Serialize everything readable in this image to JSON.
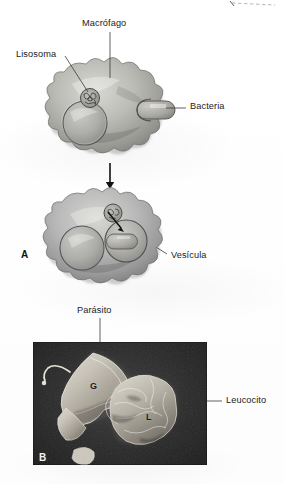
{
  "figure": {
    "kind": "textbook-figure",
    "language": "es"
  },
  "panel_a": {
    "letter": "A",
    "labels": {
      "macrofago": "Macrófago",
      "lisosoma": "Lisosoma",
      "bacteria": "Bacteria",
      "vesicula": "Vesícula"
    }
  },
  "panel_b": {
    "letter": "B",
    "labels": {
      "parasito": "Parásito",
      "leucocito": "Leucocito"
    },
    "in_image_markers": {
      "parasite_marker": "G",
      "leukocyte_marker": "L"
    }
  },
  "colors": {
    "ink": "#1b1b1b",
    "leader_line": "#3a3a3a",
    "cell_light": "#cfcfcb",
    "cell_mid": "#a9a9a4",
    "cell_dark": "#7d7d78",
    "photo_background": "#242424",
    "photo_highlight": "#d8d4cb",
    "dashed_crop_mark": "#b9b9b9",
    "paper": "#ffffff"
  }
}
